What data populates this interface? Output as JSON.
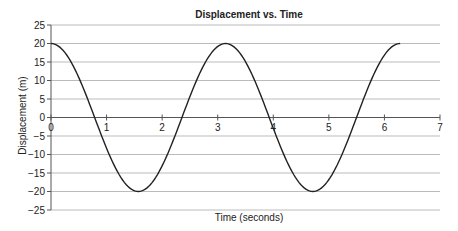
{
  "chart_data": {
    "type": "line",
    "title": "Displacement vs. Time",
    "xlabel": "Time (seconds)",
    "ylabel": "Displacement (m)",
    "xlim": [
      0,
      7
    ],
    "ylim": [
      -25,
      25
    ],
    "xticks": [
      0,
      1,
      2,
      3,
      4,
      5,
      6,
      7
    ],
    "yticks": [
      25,
      20,
      15,
      10,
      5,
      0,
      -5,
      -10,
      -15,
      -20,
      -25
    ],
    "grid": "horizontal",
    "legend": null,
    "series": [
      {
        "name": "Displacement",
        "function": "20*cos(2t)",
        "x": [
          0,
          0.39,
          0.785,
          1.18,
          1.571,
          1.96,
          2.356,
          2.75,
          3.142,
          3.53,
          3.927,
          4.32,
          4.712,
          5.1,
          5.498,
          5.89,
          6.283
        ],
        "values": [
          20,
          14.1,
          0,
          -14.1,
          -20,
          -14.1,
          0,
          14.1,
          20,
          14.1,
          0,
          -14.1,
          -20,
          -14.1,
          0,
          14.1,
          20
        ]
      }
    ],
    "colors": {
      "line": "#222222",
      "grid": "#bbbbbb",
      "axis": "#555555"
    }
  }
}
